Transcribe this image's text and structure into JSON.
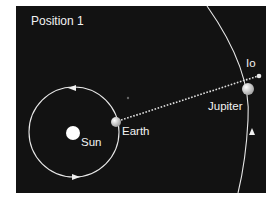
{
  "diagram": {
    "title": "Position 1",
    "labels": {
      "sun": "Sun",
      "earth": "Earth",
      "jupiter": "Jupiter",
      "io": "Io"
    },
    "colors": {
      "background": "#121212",
      "orbit": "#e8e8e8",
      "bodies": "#f5f5f5",
      "text": "#f2f2f2"
    }
  }
}
